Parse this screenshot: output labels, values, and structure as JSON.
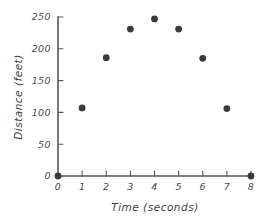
{
  "chart_data": {
    "type": "scatter",
    "title": "",
    "xlabel": "Time (seconds)",
    "ylabel": "Distance (feet)",
    "xlim": [
      0,
      8
    ],
    "ylim": [
      0,
      250
    ],
    "grid": false,
    "legend": false,
    "x_ticks": [
      0,
      1,
      2,
      3,
      4,
      5,
      6,
      7,
      8
    ],
    "x_tick_labels": [
      "0",
      "1",
      "2",
      "3",
      "4",
      "5",
      "6",
      "7",
      "8"
    ],
    "y_ticks": [
      0,
      50,
      100,
      150,
      200,
      250
    ],
    "y_tick_labels": [
      "0",
      "50",
      "100",
      "150",
      "200",
      "250"
    ],
    "marker": "filled-circle",
    "marker_color": "#3a3a3c",
    "axis_color": "#58585a",
    "background_color": "#ffffff",
    "x": [
      0,
      1,
      2,
      3,
      4,
      5,
      6,
      7,
      8
    ],
    "values": [
      0,
      107,
      186,
      231,
      247,
      231,
      185,
      106,
      0
    ],
    "points": [
      {
        "x": 0,
        "y": 0
      },
      {
        "x": 1,
        "y": 107
      },
      {
        "x": 2,
        "y": 186
      },
      {
        "x": 3,
        "y": 231
      },
      {
        "x": 4,
        "y": 247
      },
      {
        "x": 5,
        "y": 231
      },
      {
        "x": 6,
        "y": 185
      },
      {
        "x": 7,
        "y": 106
      },
      {
        "x": 8,
        "y": 0
      }
    ]
  }
}
